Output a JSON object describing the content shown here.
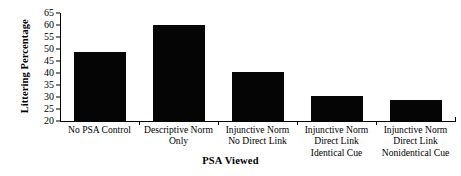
{
  "chart_data": {
    "type": "bar",
    "title": "",
    "xlabel": "PSA Viewed",
    "ylabel": "Littering Percentage",
    "categories": [
      "No PSA Control",
      "Descriptive Norm Only",
      "Injunctive Norm No Direct Link",
      "Injunctive Norm Direct Link Identical Cue",
      "Injunctive Norm Direct Link Nonidentical Cue"
    ],
    "category_lines": [
      [
        "No PSA Control"
      ],
      [
        "Descriptive Norm",
        "Only"
      ],
      [
        "Injunctive Norm",
        "No Direct Link"
      ],
      [
        "Injunctive Norm",
        "Direct Link",
        "Identical Cue"
      ],
      [
        "Injunctive Norm",
        "Direct Link",
        "Nonidentical Cue"
      ]
    ],
    "values": [
      48.7,
      60.1,
      40.3,
      30.5,
      28.6
    ],
    "ylim": [
      20,
      65
    ],
    "yticks": [
      20,
      25,
      30,
      35,
      40,
      45,
      50,
      55,
      60,
      65
    ],
    "ytick_labels": [
      "20",
      "25",
      "30",
      "35",
      "40",
      "45",
      "50",
      "55",
      "60",
      "65"
    ],
    "grid": false,
    "legend": false,
    "bar_color": "#050505",
    "axis_color": "#000000",
    "background_color": "#ffffff"
  }
}
